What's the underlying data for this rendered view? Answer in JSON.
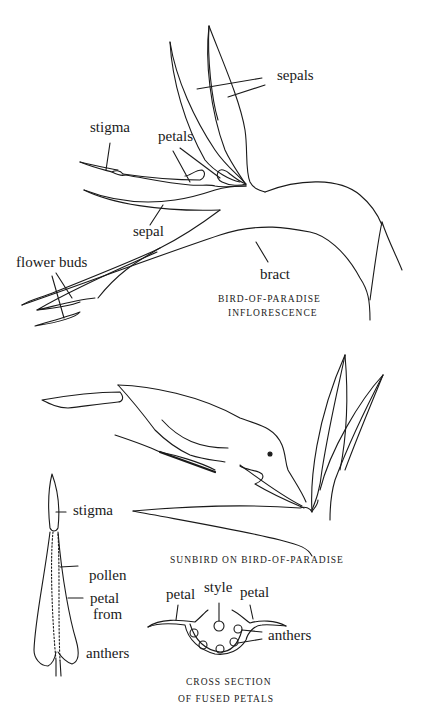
{
  "figure1": {
    "caption_line1": "BIRD-OF-PARADISE",
    "caption_line2": "INFLORESCENCE",
    "labels": {
      "sepals": "sepals",
      "stigma": "stigma",
      "petals": "petals",
      "sepal": "sepal",
      "flower_buds": "flower buds",
      "bract": "bract"
    }
  },
  "figure2": {
    "caption": "SUNBIRD ON BIRD-OF-PARADISE"
  },
  "figure3": {
    "labels": {
      "stigma": "stigma",
      "pollen_line1": "pollen",
      "pollen_line2": "from",
      "pollen_line3": "anthers",
      "petal": "petal"
    }
  },
  "figure4": {
    "caption_line1": "CROSS SECTION",
    "caption_line2": "OF FUSED PETALS",
    "labels": {
      "petal_left": "petal",
      "style": "style",
      "petal_right": "petal",
      "anthers": "anthers"
    }
  }
}
